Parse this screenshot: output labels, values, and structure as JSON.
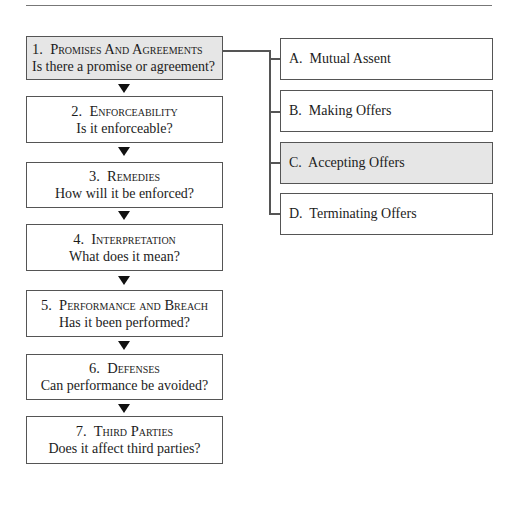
{
  "flow": {
    "steps": [
      {
        "number": "1.",
        "title": "Promises And Agreements",
        "question": "Is there a promise or agreement?",
        "highlighted": true
      },
      {
        "number": "2.",
        "title": "Enforceability",
        "question": "Is it enforceable?",
        "highlighted": false
      },
      {
        "number": "3.",
        "title": "Remedies",
        "question": "How will it be enforced?",
        "highlighted": false
      },
      {
        "number": "4.",
        "title": "Interpretation",
        "question": "What does it mean?",
        "highlighted": false
      },
      {
        "number": "5.",
        "title": "Performance and Breach",
        "question": "Has it been performed?",
        "highlighted": false
      },
      {
        "number": "6.",
        "title": "Defenses",
        "question": "Can performance be avoided?",
        "highlighted": false
      },
      {
        "number": "7.",
        "title": "Third Parties",
        "question": "Does it affect third parties?",
        "highlighted": false
      }
    ]
  },
  "subtopics": {
    "items": [
      {
        "label": "A.  Mutual Assent",
        "highlighted": false
      },
      {
        "label": "B.  Making Offers",
        "highlighted": false
      },
      {
        "label": "C.  Accepting Offers",
        "highlighted": true
      },
      {
        "label": "D.  Terminating Offers",
        "highlighted": false
      }
    ]
  },
  "colors": {
    "highlight_fill": "#e6e6e6",
    "border": "#555555",
    "arrow": "#111111"
  }
}
